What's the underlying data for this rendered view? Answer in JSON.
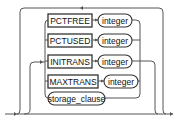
{
  "diagram": {
    "type": "railroad-syntax",
    "rows": [
      {
        "keyword": "PCTFREE",
        "value": "integer"
      },
      {
        "keyword": "PCTUSED",
        "value": "integer"
      },
      {
        "keyword": "INITRANS",
        "value": "integer"
      },
      {
        "keyword": "MAXTRANS",
        "value": "integer"
      }
    ],
    "clause": "storage_clause",
    "colors": {
      "line": "#555555",
      "border": "#333333",
      "text": "#111111",
      "background": "#ffffff"
    }
  }
}
